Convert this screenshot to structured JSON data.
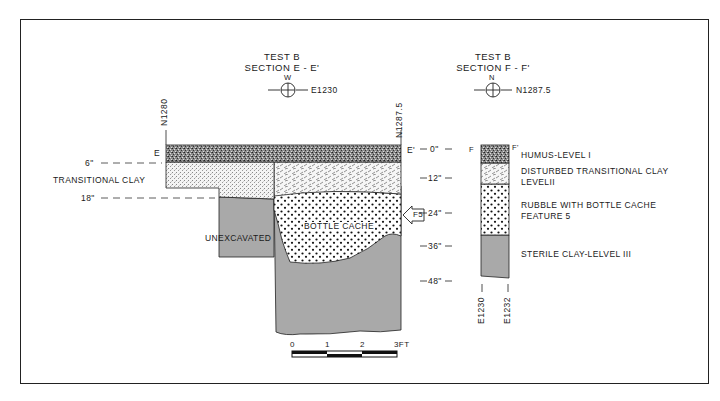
{
  "section_e": {
    "title_line1": "TEST B",
    "title_line2": "SECTION E - E'",
    "datum_direction": "W",
    "datum_label": "E1230",
    "left_grid": "N1280",
    "right_grid": "N1287.5",
    "left_end": "E",
    "right_end": "E'",
    "depth_6": "6\"",
    "depth_18": "18\"",
    "transitional_clay": "TRANSITIONAL CLAY",
    "unexcavated": "UNEXCAVATED",
    "bottle_cache": "BOTTLE CACHE",
    "feature_marker": "F5"
  },
  "section_f": {
    "title_line1": "TEST B",
    "title_line2": "SECTION F - F'",
    "datum_direction": "N",
    "datum_label": "N1287.5",
    "left_end": "F",
    "right_end": "F'",
    "bottom_left_grid": "E1230",
    "bottom_right_grid": "E1232"
  },
  "depth_scale": [
    "0\"",
    "12\"",
    "24\"",
    "36\"",
    "48\""
  ],
  "legend": {
    "layer1": "HUMUS-LEVEL I",
    "layer2_line1": "DISTURBED TRANSITIONAL CLAY",
    "layer2_line2": "LEVELII",
    "layer3_line1": "RUBBLE WITH BOTTLE CACHE",
    "layer3_line2": "FEATURE 5",
    "layer4": "STERILE CLAY-LELVEL III"
  },
  "scale_bar": {
    "ticks": [
      "0",
      "1",
      "2"
    ],
    "end_label": "3FT"
  },
  "colors": {
    "ink": "#1a1a1a",
    "clay_gray": "#a9a9a9",
    "background": "#ffffff"
  }
}
